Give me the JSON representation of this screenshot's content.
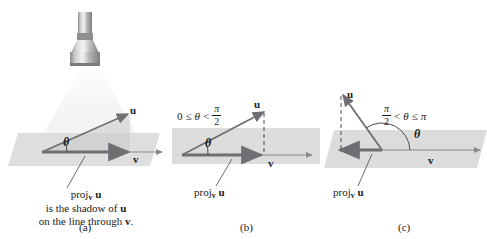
{
  "figure": {
    "colors": {
      "vector": "#6e6e73",
      "plane": "#dcdcdc",
      "light_cone": "#f0f0f0",
      "text": "#1a1a1a",
      "flashlight_body": "#9a9a9a"
    }
  },
  "panels": [
    {
      "tag": "(a)",
      "vector_u_label": "u",
      "vector_v_label": "v",
      "angle_label": "θ",
      "caption_line1_pre": "proj",
      "caption_line1_sub": "v",
      "caption_line1_post": "u",
      "caption_line2_pre": "is the shadow of ",
      "caption_line2_bold": "u",
      "caption_line3_pre": "on the line through ",
      "caption_line3_bold": "v",
      "caption_line3_post": "."
    },
    {
      "tag": "(b)",
      "vector_u_label": "u",
      "vector_v_label": "v",
      "angle_label": "θ",
      "inequality": {
        "lower": "0",
        "rel_left": "≤",
        "theta": "θ",
        "rel_right": "<",
        "frac_num": "π",
        "frac_den": "2"
      },
      "proj_pre": "proj",
      "proj_sub": "v",
      "proj_post": "u"
    },
    {
      "tag": "(c)",
      "vector_u_label": "u",
      "vector_v_label": "v",
      "angle_label": "θ",
      "inequality": {
        "frac_num": "π",
        "frac_den": "2",
        "rel_left": "<",
        "theta": "θ",
        "rel_right": "≤",
        "upper": "π"
      },
      "proj_pre": "proj",
      "proj_sub": "v",
      "proj_post": "u"
    }
  ]
}
